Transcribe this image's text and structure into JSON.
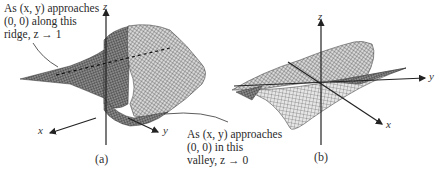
{
  "figure": {
    "panel_a": {
      "caption": "(a)",
      "annotation_ridge": {
        "line1": "As (x, y) approaches",
        "line2": "(0, 0) along this",
        "line3": "ridge, z → 1"
      },
      "annotation_valley": {
        "line1": "As (x, y) approaches",
        "line2": "(0, 0) in this",
        "line3": "valley, z → 0"
      },
      "axes": {
        "x": "x",
        "y": "y",
        "z": "z"
      }
    },
    "panel_b": {
      "caption": "(b)",
      "axes": {
        "x": "x",
        "y": "y",
        "z": "z"
      }
    },
    "colors": {
      "ink": "#222222",
      "mesh": "#555555",
      "background": "#ffffff"
    }
  }
}
